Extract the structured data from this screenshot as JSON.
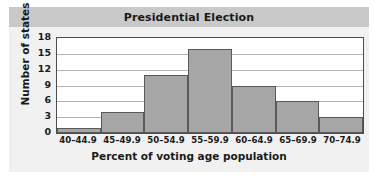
{
  "chart_data": {
    "type": "bar",
    "title": "Presidential Election",
    "xlabel": "Percent of voting age population",
    "ylabel": "Number of states",
    "categories": [
      "40–44.9",
      "45–49.9",
      "50–54.9",
      "55–59.9",
      "60–64.9",
      "65–69.9",
      "70–74.9"
    ],
    "values": [
      1,
      4,
      11,
      16,
      9,
      6,
      3
    ],
    "yticks": [
      0,
      3,
      6,
      9,
      12,
      15,
      18
    ],
    "ylim": [
      0,
      18
    ],
    "grid": true,
    "legend": "none",
    "colors": {
      "bar_fill": "#a6a6a6",
      "bar_edge": "#595959",
      "plot_background": "#ffffff",
      "panel_background": "#f1f1f1",
      "title_band": "#c9c9c9",
      "gridline": "#b3b3b3",
      "axis": "#4d4d4d",
      "text": "#1a1a1a"
    }
  }
}
